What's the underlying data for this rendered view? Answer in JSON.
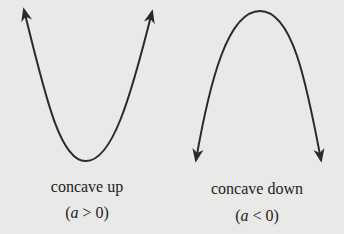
{
  "figures": [
    {
      "id": "concave-up",
      "label": "concave up",
      "condition_prefix": "(",
      "condition_var": "a",
      "condition_rest": " > 0)",
      "vertex": [
        86,
        161
      ],
      "ends": [
        [
          23,
          8
        ],
        [
          153,
          9
        ]
      ],
      "arrows": "up"
    },
    {
      "id": "concave-down",
      "label": "concave down",
      "condition_prefix": "(",
      "condition_var": "a",
      "condition_rest": " < 0)",
      "vertex": [
        260,
        11
      ],
      "ends": [
        [
          195,
          163
        ],
        [
          322,
          163
        ]
      ],
      "arrows": "down"
    }
  ],
  "colors": {
    "background": "#e9e9e7",
    "stroke": "#2a2a2a"
  }
}
